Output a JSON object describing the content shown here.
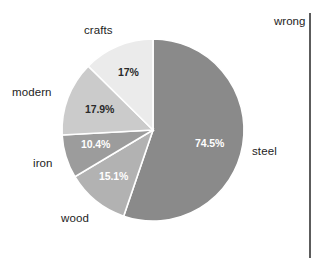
{
  "annotation": {
    "wrong_label": "wrong"
  },
  "chart_data": {
    "type": "pie",
    "title": "",
    "subtitle": "",
    "xlabel": "",
    "ylabel": "",
    "legend_position": "none",
    "grid": false,
    "labels_outside": true,
    "note": "percentages shown sum to more than 100%",
    "categories": [
      "steel",
      "wood",
      "iron",
      "modern",
      "crafts"
    ],
    "values": [
      74.5,
      15.1,
      10.4,
      17.9,
      17
    ],
    "value_labels": [
      "74.5%",
      "15.1%",
      "10.4%",
      "17.9%",
      "17%"
    ],
    "slices": [
      {
        "name": "steel",
        "label": "steel",
        "value": 74.5,
        "value_label": "74.5%",
        "color": "#8a8a8a",
        "label_text_color": "#1d1d1d",
        "value_text_color": "#ffffff"
      },
      {
        "name": "wood",
        "label": "wood",
        "value": 15.1,
        "value_label": "15.1%",
        "color": "#b2b2b2",
        "label_text_color": "#1d1d1d",
        "value_text_color": "#ffffff"
      },
      {
        "name": "iron",
        "label": "iron",
        "value": 10.4,
        "value_label": "10.4%",
        "color": "#9c9c9c",
        "label_text_color": "#1d1d1d",
        "value_text_color": "#ffffff"
      },
      {
        "name": "modern",
        "label": "modern",
        "value": 17.9,
        "value_label": "17.9%",
        "color": "#cbcbcb",
        "label_text_color": "#1d1d1d",
        "value_text_color": "#2a2a2a"
      },
      {
        "name": "crafts",
        "label": "crafts",
        "value": 17,
        "value_label": "17%",
        "color": "#ebebeb",
        "label_text_color": "#1d1d1d",
        "value_text_color": "#2a2a2a"
      }
    ],
    "geometry": {
      "center_x": 153,
      "center_y": 130,
      "radius": 91,
      "start_angle_deg": 0,
      "direction": "clockwise",
      "slice_border_color": "#ffffff"
    },
    "colors": {
      "background": "#ffffff",
      "divider": "#5c5c5c"
    }
  }
}
